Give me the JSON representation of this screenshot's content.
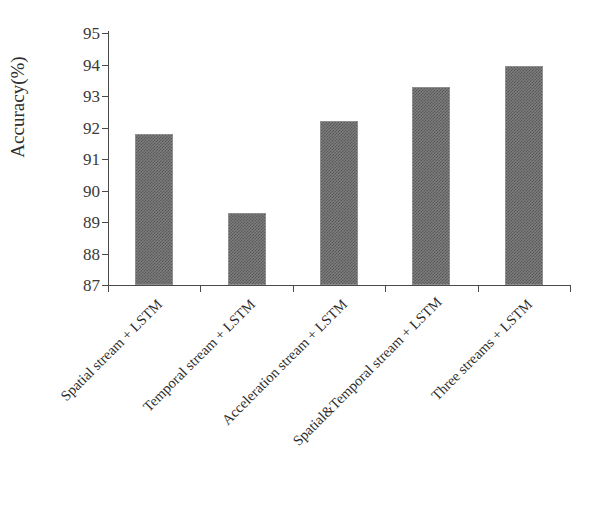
{
  "chart_data": {
    "type": "bar",
    "title": "",
    "xlabel": "",
    "ylabel": "Accuracy(%)",
    "ylim": [
      87,
      95
    ],
    "y_ticks": [
      95,
      94,
      93,
      92,
      91,
      90,
      89,
      88,
      87
    ],
    "grid": false,
    "legend": null,
    "bar_color": "#7d7d7d",
    "categories": [
      "Spatial stream + LSTM",
      "Temporal stream + LSTM",
      "Acceleration stream + LSTM",
      "Spatial&Temporal stream + LSTM",
      "Three streams + LSTM"
    ],
    "values": [
      91.8,
      89.3,
      92.2,
      93.3,
      93.95
    ]
  },
  "axes": {
    "y_title": "Accuracy(%)"
  }
}
